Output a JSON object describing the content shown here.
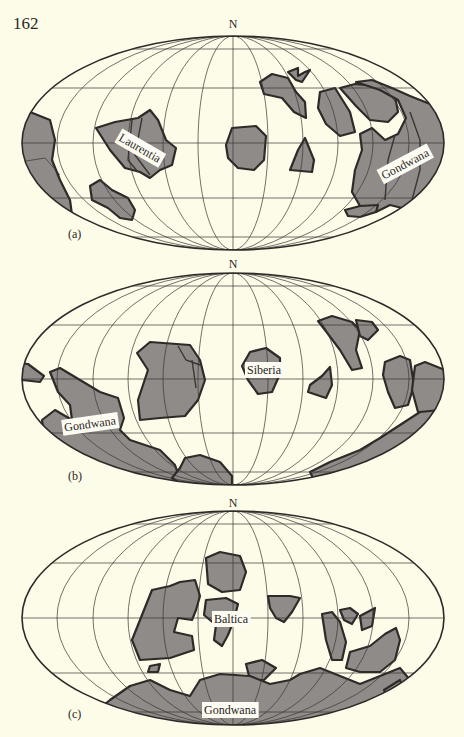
{
  "page_number": "162",
  "colors": {
    "background": "#fdfce9",
    "continent_fill": "#8f8b88",
    "outline": "#2e2a28"
  },
  "maps": [
    {
      "id": "a",
      "panel_label": "(a)",
      "north_label": "N",
      "continent_labels": [
        {
          "text": "Laurentia",
          "x": 140,
          "y": 148,
          "rotate": 30
        },
        {
          "text": "Gondwana",
          "x": 405,
          "y": 164,
          "rotate": -28
        }
      ]
    },
    {
      "id": "b",
      "panel_label": "(b)",
      "north_label": "N",
      "continent_labels": [
        {
          "text": "Siberia",
          "x": 264,
          "y": 370,
          "rotate": 0
        },
        {
          "text": "Gondwana",
          "x": 90,
          "y": 424,
          "rotate": -8
        }
      ]
    },
    {
      "id": "c",
      "panel_label": "(c)",
      "north_label": "N",
      "continent_labels": [
        {
          "text": "Baltica",
          "x": 231,
          "y": 619,
          "rotate": 0
        },
        {
          "text": "Gondwana",
          "x": 230,
          "y": 710,
          "rotate": 0
        }
      ]
    }
  ]
}
